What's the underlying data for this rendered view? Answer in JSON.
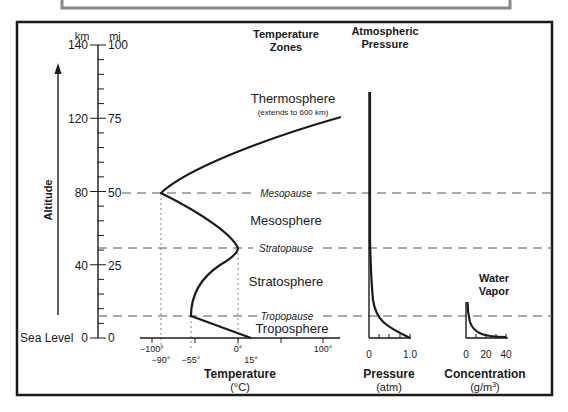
{
  "title_box": {
    "text": ""
  },
  "altitude_axis": {
    "title": "Altitude",
    "unit_left": "km",
    "unit_right": "mi",
    "ticks": [
      {
        "km": "140",
        "mi": "100",
        "y": 45
      },
      {
        "km": "120",
        "mi": "75",
        "y": 119
      },
      {
        "km": "80",
        "mi": "50",
        "y": 193
      },
      {
        "km": "40",
        "mi": "25",
        "y": 266
      },
      {
        "km": "0",
        "mi": "0",
        "y": 338
      }
    ],
    "sea_level_label": "Sea Level"
  },
  "headers": {
    "temperature_zones_1": "Temperature",
    "temperature_zones_2": "Zones",
    "pressure_1": "Atmospheric",
    "pressure_2": "Pressure",
    "water_vapor_1": "Water",
    "water_vapor_2": "Vapor"
  },
  "zones": {
    "thermosphere": "Thermosphere",
    "thermosphere_note": "(extends to 600 km)",
    "mesopause": "Mesopause",
    "mesosphere": "Mesosphere",
    "stratopause": "Stratopause",
    "stratosphere": "Stratosphere",
    "tropopause": "Tropopause",
    "troposphere": "Troposphere"
  },
  "temperature_axis": {
    "title": "Temperature",
    "unit": "(°C)",
    "major_labels": [
      {
        "label": "−100°",
        "x": 152
      },
      {
        "label": "0°",
        "x": 238
      },
      {
        "label": "100°",
        "x": 323
      }
    ],
    "marker_labels": [
      {
        "label": "−90°",
        "x": 161
      },
      {
        "label": "−55°",
        "x": 191
      },
      {
        "label": "15°",
        "x": 251
      }
    ]
  },
  "pressure_axis": {
    "title": "Pressure",
    "unit": "(atm)",
    "labels": [
      {
        "label": "0",
        "x": 369
      },
      {
        "label": "1.0",
        "x": 410
      }
    ]
  },
  "water_vapor_axis": {
    "title": "Concentration",
    "unit": "(g/m",
    "unit_sup": "3",
    "unit_close": ")",
    "labels": [
      {
        "label": "0",
        "x": 466
      },
      {
        "label": "20",
        "x": 486
      },
      {
        "label": "40",
        "x": 506
      }
    ]
  },
  "colors": {
    "ink": "#1a1a1a",
    "frame_gray": "#8a8a8a",
    "dashed": "#555555",
    "dotted": "#777777"
  },
  "chart_data": [
    {
      "type": "line",
      "title": "Temperature Zones",
      "xlabel": "Temperature (°C)",
      "ylabel": "Altitude (km)",
      "xlim": [
        -100,
        100
      ],
      "ylim": [
        0,
        140
      ],
      "series": [
        {
          "name": "Temperature profile",
          "points": [
            [
              15,
              0
            ],
            [
              -55,
              12
            ],
            [
              -55,
              20
            ],
            [
              0,
              50
            ],
            [
              -90,
              80
            ],
            [
              120,
              120
            ]
          ]
        }
      ],
      "annotations": [
        "Troposphere",
        "Tropopause",
        "Stratosphere",
        "Stratopause",
        "Mesosphere",
        "Mesopause",
        "Thermosphere (extends to 600 km)"
      ],
      "boundaries_km": {
        "tropopause": 12,
        "stratopause": 50,
        "mesopause": 80
      }
    },
    {
      "type": "line",
      "title": "Atmospheric Pressure",
      "xlabel": "Pressure (atm)",
      "xlim": [
        0,
        1.0
      ],
      "series": [
        {
          "name": "Pressure",
          "points": [
            [
              1.0,
              0
            ],
            [
              0.2,
              12
            ],
            [
              0.05,
              30
            ],
            [
              0.01,
              50
            ],
            [
              0.0,
              80
            ],
            [
              0.0,
              135
            ]
          ]
        }
      ]
    },
    {
      "type": "line",
      "title": "Water Vapor",
      "xlabel": "Concentration (g/m3)",
      "xlim": [
        0,
        40
      ],
      "series": [
        {
          "name": "Water vapor",
          "points": [
            [
              40,
              0
            ],
            [
              10,
              4
            ],
            [
              3,
              8
            ],
            [
              0,
              12
            ],
            [
              0,
              20
            ]
          ]
        }
      ]
    }
  ]
}
